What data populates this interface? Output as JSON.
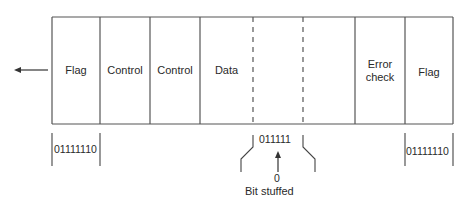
{
  "frame": {
    "direction_arrow": "left-arrow",
    "fields": [
      {
        "label": "Flag",
        "style": "solid"
      },
      {
        "label": "Control",
        "style": "solid"
      },
      {
        "label": "Control",
        "style": "solid"
      },
      {
        "label": "Data",
        "style": "dashed-right"
      },
      {
        "label": "",
        "style": "dashed"
      },
      {
        "label": "",
        "style": "solid"
      },
      {
        "label": "Error check",
        "line1": "Error",
        "line2": "check",
        "style": "solid"
      },
      {
        "label": "Flag",
        "style": "solid"
      }
    ]
  },
  "annotations": {
    "start_flag_bits": "01111110",
    "end_flag_bits": "01111110",
    "data_bits": "011111",
    "stuffed_bit": "0",
    "stuffed_label": "Bit stuffed"
  }
}
